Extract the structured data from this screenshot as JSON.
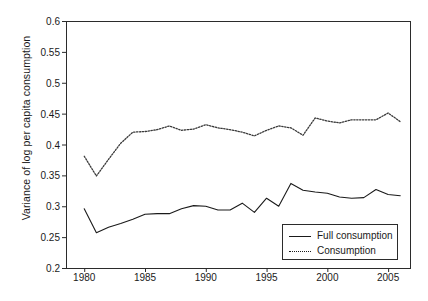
{
  "chart_data": {
    "type": "line",
    "title": "",
    "xlabel": "",
    "ylabel": "Variance of log per capita consumption",
    "xlim": [
      1978.5,
      2006.8
    ],
    "ylim": [
      0.2,
      0.6
    ],
    "grid": false,
    "legend_position": "bottom-right",
    "x_ticks": [
      1980,
      1985,
      1990,
      1995,
      2000,
      2005
    ],
    "y_ticks": [
      0.2,
      0.25,
      0.3,
      0.35,
      0.4,
      0.45,
      0.5,
      0.55,
      0.6
    ],
    "y_tick_labels": [
      "0.2",
      "0.25",
      "0.3",
      "0.35",
      "0.4",
      "0.45",
      "0.5",
      "0.55",
      "0.6"
    ],
    "x_tick_labels": [
      "1980",
      "1985",
      "1990",
      "1995",
      "2000",
      "2005"
    ],
    "x": [
      1980,
      1981,
      1982,
      1983,
      1984,
      1985,
      1986,
      1987,
      1988,
      1989,
      1990,
      1991,
      1992,
      1993,
      1994,
      1995,
      1996,
      1997,
      1998,
      1999,
      2000,
      2001,
      2002,
      2003,
      2004,
      2005,
      2006
    ],
    "series": [
      {
        "name": "Full consumption",
        "style": "solid",
        "color": "#1a1a1a",
        "values": [
          0.296,
          0.257,
          0.266,
          0.272,
          0.279,
          0.287,
          0.288,
          0.288,
          0.296,
          0.301,
          0.3,
          0.294,
          0.294,
          0.305,
          0.29,
          0.313,
          0.3,
          0.337,
          0.326,
          0.323,
          0.321,
          0.315,
          0.313,
          0.314,
          0.327,
          0.319,
          0.317
        ]
      },
      {
        "name": "Consumption",
        "style": "dotted",
        "color": "#3a3a3a",
        "values": [
          0.381,
          0.349,
          0.376,
          0.402,
          0.42,
          0.421,
          0.424,
          0.43,
          0.423,
          0.425,
          0.432,
          0.427,
          0.424,
          0.42,
          0.414,
          0.423,
          0.43,
          0.427,
          0.415,
          0.443,
          0.438,
          0.435,
          0.44,
          0.44,
          0.44,
          0.451,
          0.437
        ]
      }
    ]
  },
  "legend": {
    "entries": [
      {
        "label": "Full consumption",
        "style": "solid"
      },
      {
        "label": "Consumption",
        "style": "dotted"
      }
    ]
  }
}
